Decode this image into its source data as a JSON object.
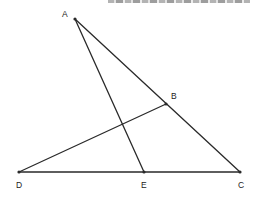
{
  "figure": {
    "clipped_header_text": "",
    "points": [
      {
        "name": "A",
        "x": 75,
        "y": 19,
        "label_x": 62,
        "label_y": 17
      },
      {
        "name": "B",
        "x": 166,
        "y": 104,
        "label_x": 171,
        "label_y": 99
      },
      {
        "name": "C",
        "x": 240,
        "y": 172,
        "label_x": 238,
        "label_y": 188
      },
      {
        "name": "D",
        "x": 19,
        "y": 172,
        "label_x": 16,
        "label_y": 188
      },
      {
        "name": "E",
        "x": 144,
        "y": 172,
        "label_x": 141,
        "label_y": 188
      }
    ],
    "segments": [
      {
        "from": "A",
        "to": "C"
      },
      {
        "from": "A",
        "to": "E"
      },
      {
        "from": "D",
        "to": "B"
      },
      {
        "from": "D",
        "to": "C"
      }
    ],
    "labels": {
      "A": "A",
      "B": "B",
      "C": "C",
      "D": "D",
      "E": "E"
    },
    "stroke_color": "#2a2a2a"
  }
}
